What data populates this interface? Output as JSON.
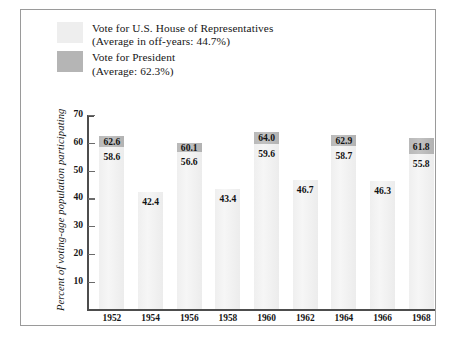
{
  "legend": {
    "entries": [
      {
        "swatch": "house",
        "line1": "Vote for U.S. House of Representatives",
        "line2": "(Average in off-years: 44.7%)"
      },
      {
        "swatch": "president",
        "line1": "Vote for President",
        "line2": "(Average: 62.3%)"
      }
    ]
  },
  "axes": {
    "y_title": "Percent of voting-age population participating",
    "y_ticks": [
      "70",
      "60",
      "50",
      "40",
      "30",
      "20",
      "10"
    ]
  },
  "caption_remnant": "",
  "chart_data": {
    "type": "bar",
    "title": "",
    "subtitle": "",
    "xlabel": "",
    "ylabel": "Percent of voting-age population participating",
    "ylim": [
      0,
      70
    ],
    "ytick_step": 10,
    "grid": false,
    "legend_position": "above-plot-left",
    "colors": {
      "house": "#efefef",
      "president": "#b9b9b9",
      "axis": "#4d4d4d",
      "frame": "#9a9a9a",
      "text": "#161616"
    },
    "categories": [
      "1952",
      "1954",
      "1956",
      "1958",
      "1960",
      "1962",
      "1964",
      "1966",
      "1968"
    ],
    "series": [
      {
        "name": "Vote for U.S. House of Representatives",
        "average_label": "(Average in off-years: 44.7%)",
        "average": 44.7,
        "values": [
          58.6,
          42.4,
          56.6,
          43.4,
          59.6,
          46.7,
          58.7,
          46.3,
          55.8
        ]
      },
      {
        "name": "Vote for President",
        "average_label": "(Average: 62.3%)",
        "average": 62.3,
        "values": [
          62.6,
          null,
          60.1,
          null,
          64.0,
          null,
          62.9,
          null,
          61.8
        ]
      }
    ],
    "bars": [
      {
        "year": "1952",
        "house": 58.6,
        "president": 62.6
      },
      {
        "year": "1954",
        "house": 42.4,
        "president": null
      },
      {
        "year": "1956",
        "house": 56.6,
        "president": 60.1
      },
      {
        "year": "1958",
        "house": 43.4,
        "president": null
      },
      {
        "year": "1960",
        "house": 59.6,
        "president": 64.0
      },
      {
        "year": "1962",
        "house": 46.7,
        "president": null
      },
      {
        "year": "1964",
        "house": 58.7,
        "president": 62.9
      },
      {
        "year": "1966",
        "house": 46.3,
        "president": null
      },
      {
        "year": "1968",
        "house": 55.8,
        "president": 61.8
      }
    ]
  }
}
